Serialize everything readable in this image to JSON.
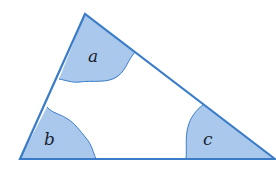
{
  "diagram": {
    "type": "triangle-angles",
    "vertices": {
      "top": [
        85,
        14
      ],
      "bottom_left": [
        20,
        159
      ],
      "bottom_right": [
        275,
        159
      ]
    },
    "angles": [
      {
        "id": "a",
        "label": "a",
        "position": "top",
        "label_xy": [
          93,
          62
        ]
      },
      {
        "id": "b",
        "label": "b",
        "position": "bottom-left",
        "label_xy": [
          48,
          145
        ]
      },
      {
        "id": "c",
        "label": "c",
        "position": "bottom-right",
        "label_xy": [
          207,
          145
        ]
      }
    ],
    "colors": {
      "fill": "#a9c8ec",
      "stroke": "#3a7cc8",
      "background": "#ffffff",
      "text": "#1a1f2e"
    }
  }
}
